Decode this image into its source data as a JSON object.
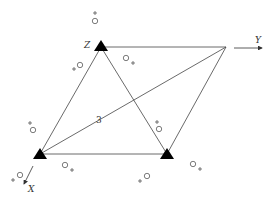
{
  "diagram": {
    "type": "electrode-array",
    "labels": {
      "z": "Z",
      "y": "Y",
      "x": "X",
      "diagonal": "3"
    },
    "colors": {
      "line": "#444444",
      "marker": "#000000",
      "background": "#ffffff"
    },
    "vertices": [
      {
        "name": "Z",
        "x": 101,
        "y": 41,
        "marker": "filled-triangle"
      },
      {
        "name": "top-right",
        "x": 226,
        "y": 47,
        "marker": "none"
      },
      {
        "name": "bottom-left",
        "x": 40,
        "y": 157,
        "marker": "filled-triangle"
      },
      {
        "name": "bottom-right",
        "x": 167,
        "y": 157,
        "marker": "filled-triangle"
      }
    ],
    "symbols": [
      {
        "glyph": "○+",
        "x": 95,
        "y": 20,
        "plus_pos": "above"
      },
      {
        "glyph": "○+",
        "x": 126,
        "y": 60,
        "plus_pos": "right"
      },
      {
        "glyph": "+○",
        "x": 77,
        "y": 66,
        "plus_pos": "left"
      },
      {
        "glyph": "○+",
        "x": 31,
        "y": 130,
        "plus_pos": "above"
      },
      {
        "glyph": "○+",
        "x": 65,
        "y": 167,
        "plus_pos": "right"
      },
      {
        "glyph": "+○",
        "x": 19,
        "y": 176,
        "plus_pos": "left"
      },
      {
        "glyph": "○+",
        "x": 159,
        "y": 129,
        "plus_pos": "above"
      },
      {
        "glyph": "○+",
        "x": 193,
        "y": 164,
        "plus_pos": "right"
      },
      {
        "glyph": "+○",
        "x": 146,
        "y": 176,
        "plus_pos": "left"
      }
    ]
  }
}
